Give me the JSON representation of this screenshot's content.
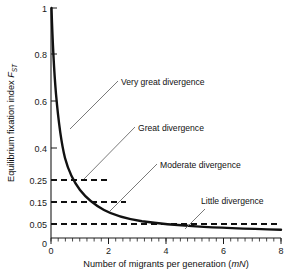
{
  "chart_data": {
    "type": "line",
    "title": "",
    "xlabel": "Number of migrants per generation (mN)",
    "xlabel_plain": "Number of migrants per generation",
    "xlabel_symbol": "mN",
    "ylabel_plain": "Equilibrium fixation index",
    "ylabel_symbol": "F",
    "ylabel_subscript": "ST",
    "xlim": [
      0,
      8
    ],
    "ylim": [
      0,
      1
    ],
    "grid": false,
    "legend": "none",
    "x_ticks": [
      0,
      2,
      4,
      6,
      8
    ],
    "x_tick_labels": [
      "0",
      "2",
      "4",
      "6",
      "8"
    ],
    "x_minor_tick_step": 0.25,
    "y_ticks": [
      0,
      0.05,
      0.15,
      0.25,
      0.4,
      0.6,
      0.8,
      1
    ],
    "y_tick_labels": [
      "0",
      "0.05",
      "0.15",
      "0.25",
      "0.4",
      "0.6",
      "0.8",
      "1"
    ],
    "curve_formula": "Fst = 1 / (4mN + 1)",
    "series": [
      {
        "name": "Equilibrium FST",
        "x": [
          0,
          0.1,
          0.2,
          0.3,
          0.4,
          0.5,
          0.6,
          0.75,
          0.9,
          1.0,
          1.2,
          1.42,
          1.6,
          1.8,
          2.0,
          2.5,
          3.0,
          3.5,
          4.0,
          4.75,
          5.5,
          6.0,
          6.5,
          7.0,
          7.5,
          8.0
        ],
        "y": [
          1.0,
          0.714,
          0.556,
          0.455,
          0.385,
          0.333,
          0.294,
          0.25,
          0.217,
          0.2,
          0.172,
          0.15,
          0.135,
          0.122,
          0.111,
          0.091,
          0.077,
          0.067,
          0.059,
          0.05,
          0.043,
          0.04,
          0.037,
          0.034,
          0.032,
          0.03
        ]
      }
    ],
    "threshold_lines": [
      {
        "name": "very-great-threshold",
        "value": 0.25,
        "label": "0.25",
        "x_end": 2.0
      },
      {
        "name": "great-threshold",
        "value": 0.15,
        "label": "0.15",
        "x_end": 2.6
      },
      {
        "name": "little-threshold",
        "value": 0.05,
        "label": "0.05",
        "x_end": 8.0
      }
    ],
    "annotations": [
      {
        "name": "very-great-divergence",
        "label": "Very great divergence",
        "text_x": 121,
        "text_y": 85,
        "leader_from_x": 70,
        "leader_from_y": 129,
        "leader_to_x": 118,
        "leader_to_y": 81
      },
      {
        "name": "great-divergence",
        "label": "Great divergence",
        "text_x": 138,
        "text_y": 131,
        "leader_from_x": 84,
        "leader_from_y": 179,
        "leader_to_x": 135,
        "leader_to_y": 127
      },
      {
        "name": "moderate-divergence",
        "label": "Moderate divergence",
        "text_x": 160,
        "text_y": 168,
        "leader_from_x": 110,
        "leader_from_y": 211,
        "leader_to_x": 157,
        "leader_to_y": 164
      },
      {
        "name": "little-divergence",
        "label": "Little divergence",
        "text_x": 201,
        "text_y": 204,
        "leader_from_x": 185,
        "leader_from_y": 229,
        "leader_to_x": 205,
        "leader_to_y": 209
      }
    ]
  }
}
